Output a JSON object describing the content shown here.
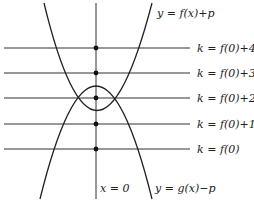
{
  "diagram": {
    "curves": [
      {
        "id": "upper",
        "label": "y = f(x)+p",
        "opens": "up"
      },
      {
        "id": "lower",
        "label": "y = g(x)−p",
        "opens": "down"
      }
    ],
    "axis_label": "x = 0",
    "lines": [
      {
        "label": "k = f(0)+4"
      },
      {
        "label": "k = f(0)+3"
      },
      {
        "label": "k = f(0)+2"
      },
      {
        "label": "k = f(0)+1"
      },
      {
        "label": "k = f(0)"
      }
    ],
    "colors": {
      "stroke": "#222222",
      "background": "#ffffff"
    }
  }
}
